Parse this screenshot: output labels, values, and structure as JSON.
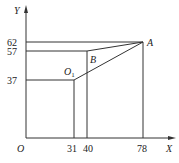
{
  "diagram": {
    "axes": {
      "x_label": "X",
      "y_label": "Y",
      "origin_label": "O"
    },
    "x_ticks": [
      "31",
      "40",
      "78"
    ],
    "y_ticks": [
      "62",
      "57",
      "37"
    ],
    "points": {
      "A": {
        "label": "A",
        "x": 78,
        "y": 62
      },
      "B": {
        "label": "B",
        "x": 40,
        "y": 57
      },
      "O1": {
        "label": "O",
        "subscript": "1",
        "x": 31,
        "y": 37
      }
    },
    "colors": {
      "line": "#333333",
      "text": "#222222"
    }
  }
}
